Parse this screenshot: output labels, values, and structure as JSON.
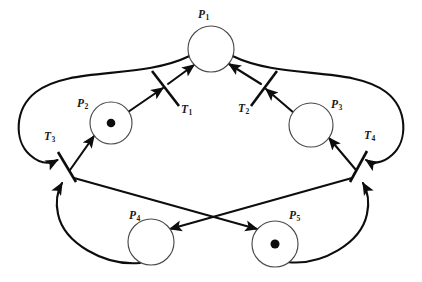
{
  "diagram": {
    "type": "petri-net",
    "width": 422,
    "height": 282,
    "background_color": "#ffffff",
    "stroke_color": "#0d0d0d",
    "place_stroke_color": "#4a4a4a",
    "token_color": "#0d0d0d"
  },
  "places": [
    {
      "id": "P1",
      "label": "P",
      "sub": "1",
      "cx": 211,
      "cy": 49,
      "r": 23,
      "tokens": 0,
      "label_x": 198,
      "label_y": 9
    },
    {
      "id": "P2",
      "label": "P",
      "sub": "2",
      "cx": 111,
      "cy": 123,
      "r": 21,
      "tokens": 1,
      "label_x": 77,
      "label_y": 98
    },
    {
      "id": "P3",
      "label": "P",
      "sub": "3",
      "cx": 311,
      "cy": 125,
      "r": 22,
      "tokens": 0,
      "label_x": 331,
      "label_y": 99
    },
    {
      "id": "P4",
      "label": "P",
      "sub": "4",
      "cx": 151,
      "cy": 242,
      "r": 23,
      "tokens": 0,
      "label_x": 129,
      "label_y": 210
    },
    {
      "id": "P5",
      "label": "P",
      "sub": "5",
      "cx": 275,
      "cy": 244,
      "r": 23,
      "tokens": 1,
      "label_x": 289,
      "label_y": 210
    }
  ],
  "transitions": [
    {
      "id": "T1",
      "label": "T",
      "sub": "1",
      "x1": 152,
      "y1": 71,
      "x2": 179,
      "y2": 106,
      "label_x": 181,
      "label_y": 104
    },
    {
      "id": "T2",
      "label": "T",
      "sub": "2",
      "x1": 277,
      "y1": 71,
      "x2": 251,
      "y2": 106,
      "label_x": 238,
      "label_y": 103
    },
    {
      "id": "T3",
      "label": "T",
      "sub": "3",
      "x1": 58,
      "y1": 152,
      "x2": 76,
      "y2": 182,
      "label_x": 44,
      "label_y": 131
    },
    {
      "id": "T4",
      "label": "T",
      "sub": "4",
      "x1": 367,
      "y1": 151,
      "x2": 350,
      "y2": 182,
      "label_x": 364,
      "label_y": 130
    }
  ],
  "arcs": [
    {
      "from": "P2",
      "to": "T1",
      "kind": "straight-arrow"
    },
    {
      "from": "T1",
      "to": "P1",
      "kind": "straight-arrow"
    },
    {
      "from": "P3",
      "to": "T2",
      "kind": "straight-arrow"
    },
    {
      "from": "T2",
      "to": "P1",
      "kind": "straight-arrow"
    },
    {
      "from": "P1",
      "to": "T3",
      "kind": "curved-arrow-left-outer"
    },
    {
      "from": "P1",
      "to": "T4",
      "kind": "curved-arrow-right-outer"
    },
    {
      "from": "T3",
      "to": "P2",
      "kind": "straight-arrow"
    },
    {
      "from": "T4",
      "to": "P3",
      "kind": "straight-arrow"
    },
    {
      "from": "T3",
      "to": "P5",
      "kind": "straight-arrow-cross"
    },
    {
      "from": "T4",
      "to": "P4",
      "kind": "straight-arrow-cross"
    },
    {
      "from": "P4",
      "to": "T3",
      "kind": "curved-arrow-bottom-left"
    },
    {
      "from": "P5",
      "to": "T4",
      "kind": "curved-arrow-bottom-right"
    }
  ]
}
